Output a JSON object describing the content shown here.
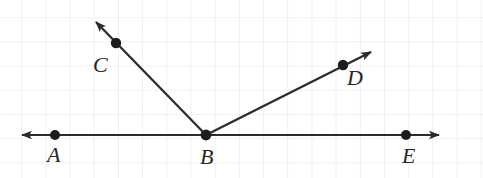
{
  "figure": {
    "type": "geometry-diagram",
    "background": {
      "color": "#ffffff",
      "grid": true,
      "grid_color": "#c3cde0",
      "grid_spacing_px": 24
    },
    "style": {
      "stroke_color": "#2b2b2b",
      "stroke_width_px": 2,
      "point_color": "#1c1c1c",
      "point_radius_px": 5,
      "label_color": "#262626",
      "label_font_size_px": 22
    },
    "points": [
      {
        "id": "A",
        "label": "A",
        "x": 55,
        "y": 135,
        "label_x": 47,
        "label_y": 144
      },
      {
        "id": "B",
        "label": "B",
        "x": 206,
        "y": 135,
        "label_x": 200,
        "label_y": 146
      },
      {
        "id": "C",
        "label": "C",
        "x": 116,
        "y": 43,
        "label_x": 93,
        "label_y": 54
      },
      {
        "id": "D",
        "label": "D",
        "x": 343,
        "y": 65,
        "label_x": 347,
        "label_y": 67
      },
      {
        "id": "E",
        "label": "E",
        "x": 406,
        "y": 135,
        "label_x": 402,
        "label_y": 145
      }
    ],
    "lines": [
      {
        "id": "line-AE",
        "name": "line-ae",
        "kind": "line",
        "arrows": "both",
        "x1": 13,
        "y1": 135,
        "x2": 448,
        "y2": 135
      }
    ],
    "rays": [
      {
        "id": "ray-BC",
        "name": "ray-bc",
        "kind": "ray",
        "arrows": "end",
        "x1": 206,
        "y1": 135,
        "x2": 88,
        "y2": 14,
        "through": "C"
      },
      {
        "id": "ray-BD",
        "name": "ray-bd",
        "kind": "ray",
        "arrows": "end",
        "x1": 206,
        "y1": 135,
        "x2": 379,
        "y2": 48,
        "through": "D"
      }
    ]
  }
}
